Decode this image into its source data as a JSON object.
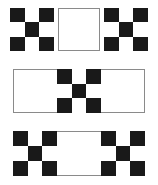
{
  "figure": {
    "width": 158,
    "height": 185,
    "background_color": "#ffffff",
    "dark_color": "#191919",
    "light_color": "#ffffff",
    "border_color": "#8a8a8a"
  },
  "patterns": {
    "checker_3x3": {
      "name": "checkerboard-3x3",
      "rows": 3,
      "cols": 3,
      "cells": [
        [
          "dark",
          "light",
          "dark"
        ],
        [
          "light",
          "dark",
          "light"
        ],
        [
          "dark",
          "light",
          "dark"
        ]
      ]
    },
    "white_panel": {
      "name": "plain-white-panel",
      "fill": "light"
    }
  },
  "rows": [
    {
      "id": "row-1",
      "label": "Row 1: checker, white square, checker",
      "tiles": [
        {
          "id": "r1-check-left",
          "type": "checker_3x3",
          "label": "Left checkerboard square"
        },
        {
          "id": "r1-white-mid",
          "type": "white_panel",
          "label": "Center white square"
        },
        {
          "id": "r1-check-right",
          "type": "checker_3x3",
          "label": "Right checkerboard square"
        }
      ]
    },
    {
      "id": "row-2",
      "label": "Row 2: wide white strip with center checkerboard",
      "tiles": [
        {
          "id": "r2-strip",
          "type": "white_panel",
          "label": "Wide white strip"
        },
        {
          "id": "r2-check-mid",
          "type": "checker_3x3",
          "label": "Center checkerboard square"
        }
      ]
    },
    {
      "id": "row-3",
      "label": "Row 3: checker, white gap, checker in one wide strip",
      "tiles": [
        {
          "id": "r3-strip",
          "type": "white_panel",
          "label": "Wide white strip"
        },
        {
          "id": "r3-check-left",
          "type": "checker_3x3",
          "label": "Left checkerboard square"
        },
        {
          "id": "r3-check-right",
          "type": "checker_3x3",
          "label": "Right checkerboard square"
        }
      ]
    }
  ]
}
